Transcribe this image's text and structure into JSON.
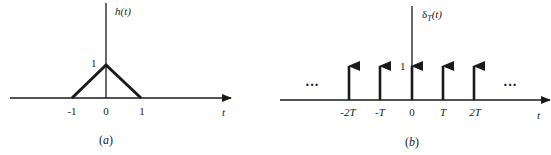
{
  "figure_a": {
    "caption": "(a)",
    "y_label_fn": "h",
    "y_label_arg": "(t)",
    "x_axis_label": "t",
    "peak_label": "1",
    "ticks": [
      "-1",
      "0",
      "1"
    ]
  },
  "figure_b": {
    "caption": "(b)",
    "y_label_symbol": "δ",
    "y_label_sub": "T",
    "y_label_arg": "(t)",
    "x_axis_label": "t",
    "height_label": "1",
    "ticks": [
      "-2T",
      "-T",
      "0",
      "T",
      "2T"
    ],
    "ellipsis_left": "···",
    "ellipsis_right": "···"
  },
  "colors": {
    "stroke": "#1a1a1a",
    "background": "#ffffff"
  }
}
